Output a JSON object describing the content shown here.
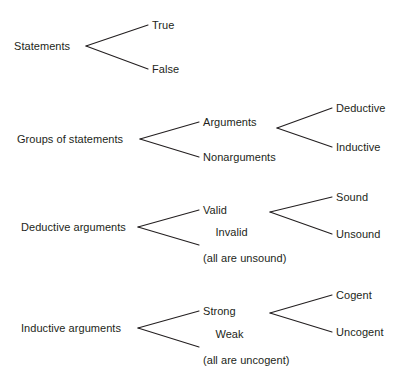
{
  "diagram": {
    "type": "tree-taxonomy",
    "background_color": "#ffffff",
    "line_color": "#231f20",
    "text_color": "#231f20",
    "groups": [
      {
        "id": "statements",
        "root": {
          "label": "Statements",
          "x": 14,
          "y": 46
        },
        "branches": [
          {
            "label": "True",
            "x": 152,
            "y": 25
          },
          {
            "label": "False",
            "x": 152,
            "y": 69
          }
        ]
      },
      {
        "id": "groups-of-statements",
        "root": {
          "label": "Groups of statements",
          "x": 17,
          "y": 139
        },
        "branches": [
          {
            "label": "Arguments",
            "x": 203,
            "y": 122
          },
          {
            "label": "Nonarguments",
            "x": 203,
            "y": 157
          }
        ],
        "subbranches": [
          {
            "label": "Deductive",
            "x": 336,
            "y": 108
          },
          {
            "label": "Inductive",
            "x": 336,
            "y": 147
          }
        ]
      },
      {
        "id": "deductive-arguments",
        "root": {
          "label": "Deductive arguments",
          "x": 21,
          "y": 227
        },
        "branches": [
          {
            "label": "Valid",
            "x": 203,
            "y": 210
          },
          {
            "label": "Invalid",
            "sub": "(all are unsound)",
            "x": 203,
            "y": 245
          }
        ],
        "subbranches": [
          {
            "label": "Sound",
            "x": 336,
            "y": 197
          },
          {
            "label": "Unsound",
            "x": 336,
            "y": 234
          }
        ]
      },
      {
        "id": "inductive-arguments",
        "root": {
          "label": "Inductive arguments",
          "x": 21,
          "y": 328
        },
        "branches": [
          {
            "label": "Strong",
            "x": 203,
            "y": 311
          },
          {
            "label": "Weak",
            "sub": "(all are uncogent)",
            "x": 203,
            "y": 347
          }
        ],
        "subbranches": [
          {
            "label": "Cogent",
            "x": 336,
            "y": 295
          },
          {
            "label": "Uncogent",
            "x": 336,
            "y": 332
          }
        ]
      }
    ]
  }
}
